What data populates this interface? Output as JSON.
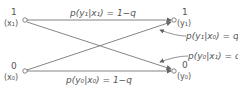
{
  "diagram": {
    "inputs": [
      {
        "value": "1",
        "symbol": "(x₁)"
      },
      {
        "value": "0",
        "symbol": "(x₀)"
      }
    ],
    "outputs": [
      {
        "value": "1",
        "symbol": "(y₁)"
      },
      {
        "value": "0",
        "symbol": "(y₀)"
      }
    ],
    "edges": [
      {
        "from": "x1",
        "to": "y1",
        "label": "p(y₁|x₁) = 1−q"
      },
      {
        "from": "x0",
        "to": "y1",
        "label": "p(y₁|x₀) = q"
      },
      {
        "from": "x1",
        "to": "y0",
        "label": "p(y₀|x₁) = q"
      },
      {
        "from": "x0",
        "to": "y0",
        "label": "p(y₀|x₀) = 1−q"
      }
    ]
  }
}
